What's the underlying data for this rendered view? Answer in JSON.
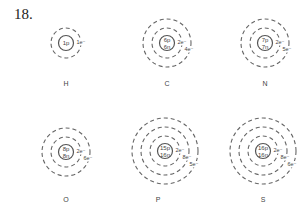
{
  "question_number": "18.",
  "atoms": [
    {
      "symbol": "H",
      "nucleus": [
        "1p"
      ],
      "shells": [
        "1e⁻"
      ],
      "cx": 66,
      "cy": 43,
      "label_x": 66,
      "label_y": 86
    },
    {
      "symbol": "C",
      "nucleus": [
        "6p",
        "6n"
      ],
      "shells": [
        "2e⁻",
        "4e⁻"
      ],
      "cx": 167,
      "cy": 43,
      "label_x": 167,
      "label_y": 86
    },
    {
      "symbol": "N",
      "nucleus": [
        "7p",
        "7n"
      ],
      "shells": [
        "2e⁻",
        "5e⁻"
      ],
      "cx": 265,
      "cy": 43,
      "label_x": 265,
      "label_y": 86
    },
    {
      "symbol": "O",
      "nucleus": [
        "8p",
        "8n"
      ],
      "shells": [
        "2e⁻",
        "6e⁻"
      ],
      "cx": 66,
      "cy": 152,
      "label_x": 66,
      "label_y": 202
    },
    {
      "symbol": "P",
      "nucleus": [
        "15p",
        "16n"
      ],
      "shells": [
        "2e⁻",
        "8e⁻",
        "5e⁻"
      ],
      "cx": 165,
      "cy": 151,
      "label_x": 158,
      "label_y": 202
    },
    {
      "symbol": "S",
      "nucleus": [
        "16p",
        "16n"
      ],
      "shells": [
        "2e⁻",
        "8e⁻",
        "6e⁻"
      ],
      "cx": 263,
      "cy": 151,
      "label_x": 263,
      "label_y": 202
    }
  ]
}
